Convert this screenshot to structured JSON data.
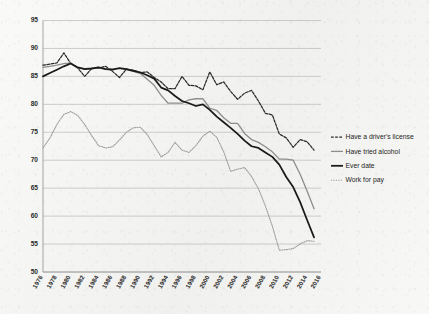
{
  "chart_data": {
    "type": "line",
    "title": "",
    "subtitle": "",
    "xlabel": "",
    "ylabel": "",
    "xlim": [
      1976,
      2016
    ],
    "ylim": [
      50,
      95
    ],
    "grid": true,
    "legend_position": "right",
    "y_ticks": [
      50,
      55,
      60,
      65,
      70,
      75,
      80,
      85,
      90,
      95
    ],
    "y_tick_labels": [
      "50",
      "55",
      "60",
      "65",
      "70",
      "75",
      "80",
      "85",
      "90",
      "95"
    ],
    "x_ticks": [
      1976,
      1978,
      1980,
      1982,
      1984,
      1986,
      1988,
      1990,
      1992,
      1994,
      1996,
      1998,
      2000,
      2002,
      2004,
      2006,
      2008,
      2010,
      2012,
      2014,
      2016
    ],
    "x_tick_labels": [
      "1976",
      "1978",
      "1980",
      "1982",
      "1984",
      "1986",
      "1988",
      "1990",
      "1992",
      "1994",
      "1996",
      "1998",
      "2000",
      "2002",
      "2004",
      "2006",
      "2008",
      "2010",
      "2012",
      "2014",
      "2016"
    ],
    "x": [
      1976,
      1977,
      1978,
      1979,
      1980,
      1981,
      1982,
      1983,
      1984,
      1985,
      1986,
      1987,
      1988,
      1989,
      1990,
      1991,
      1992,
      1993,
      1994,
      1995,
      1996,
      1997,
      1998,
      1999,
      2000,
      2001,
      2002,
      2003,
      2004,
      2005,
      2006,
      2007,
      2008,
      2009,
      2010,
      2011,
      2012,
      2013,
      2014,
      2015
    ],
    "series": [
      {
        "name": "Have a driver's license",
        "color": "#2b2b2b",
        "style": "dashed",
        "width": 1.25,
        "values": [
          87.0,
          87.2,
          87.4,
          89.2,
          87.3,
          86.5,
          85.0,
          86.4,
          86.5,
          86.8,
          85.9,
          84.8,
          86.3,
          86.1,
          85.7,
          85.8,
          84.8,
          84.0,
          82.8,
          82.8,
          85.0,
          83.4,
          83.3,
          82.6,
          85.8,
          83.5,
          84.0,
          82.3,
          80.9,
          82.0,
          82.5,
          80.6,
          78.4,
          78.1,
          74.7,
          74.0,
          72.3,
          73.7,
          73.3,
          71.8
        ]
      },
      {
        "name": "Have tried alcohol",
        "color": "#8d8d8d",
        "style": "solid",
        "width": 1.3,
        "values": [
          86.6,
          86.8,
          87.0,
          87.3,
          87.4,
          86.5,
          86.4,
          86.5,
          86.6,
          86.4,
          86.3,
          86.4,
          86.2,
          85.9,
          85.5,
          84.5,
          83.4,
          81.6,
          80.2,
          80.2,
          80.2,
          80.8,
          81.0,
          81.0,
          79.3,
          78.9,
          77.6,
          76.6,
          76.6,
          74.8,
          73.7,
          73.2,
          72.4,
          71.5,
          70.2,
          70.2,
          70.0,
          67.5,
          64.5,
          61.3
        ]
      },
      {
        "name": "Ever date",
        "color": "#1a1a1a",
        "style": "solid",
        "width": 1.75,
        "values": [
          85.0,
          85.6,
          86.2,
          86.8,
          87.3,
          86.6,
          86.3,
          86.4,
          86.6,
          86.3,
          86.2,
          86.5,
          86.3,
          86.0,
          85.7,
          85.2,
          84.6,
          83.0,
          82.5,
          81.5,
          80.6,
          80.2,
          79.7,
          80.0,
          79.0,
          77.8,
          76.8,
          75.8,
          74.7,
          73.5,
          72.5,
          72.2,
          71.4,
          70.6,
          69.2,
          67.0,
          65.2,
          62.5,
          59.3,
          56.2
        ]
      },
      {
        "name": "Work for pay",
        "color": "#9a9a9a",
        "style": "dotted",
        "width": 1.05,
        "values": [
          72.2,
          74.0,
          76.4,
          78.2,
          78.7,
          78.0,
          76.4,
          74.4,
          72.6,
          72.2,
          72.4,
          73.6,
          75.0,
          75.8,
          75.9,
          74.6,
          72.6,
          70.6,
          71.4,
          73.2,
          71.8,
          71.4,
          72.6,
          74.3,
          75.2,
          74.1,
          71.5,
          68.0,
          68.4,
          68.7,
          67.1,
          64.9,
          61.8,
          58.2,
          53.9,
          54.0,
          54.2,
          55.0,
          55.6,
          55.5
        ]
      }
    ]
  },
  "legend": {
    "items": [
      {
        "label": "Have a driver's license",
        "swatch": "dashed-dark"
      },
      {
        "label": "Have tried alcohol",
        "swatch": "solid-gray"
      },
      {
        "label": "Ever date",
        "swatch": "solid-black-thick"
      },
      {
        "label": "Work for pay",
        "swatch": "dotted-gray"
      }
    ]
  },
  "colors": {
    "background": "#f3f3f1",
    "gridline": "#b9b9b9",
    "axis": "#8f8f8f",
    "text": "#2a2a2a"
  }
}
